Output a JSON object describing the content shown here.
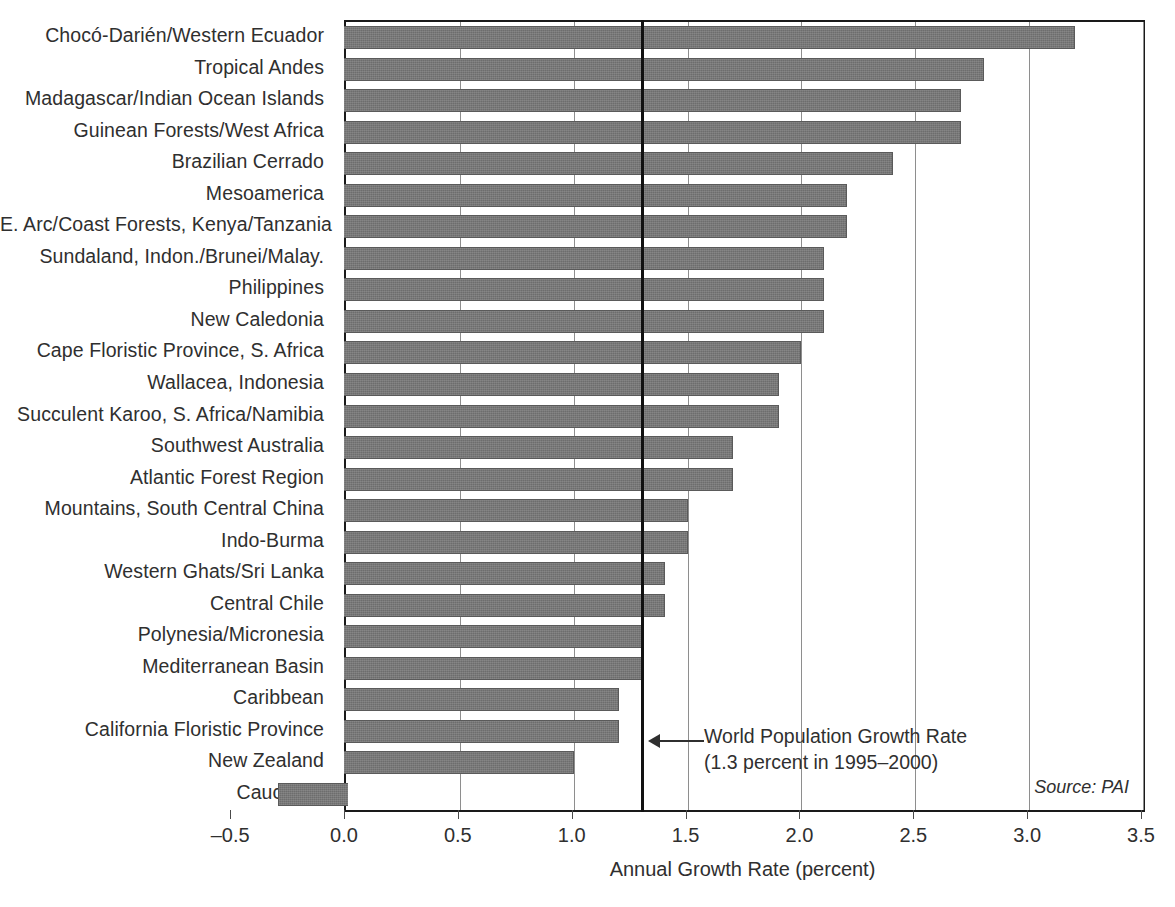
{
  "chart_data": {
    "type": "bar",
    "orientation": "horizontal",
    "title": "",
    "xlabel": "Annual Growth Rate (percent)",
    "ylabel": "",
    "xlim": [
      -0.5,
      3.5
    ],
    "xticks": [
      "-0.5",
      "0.0",
      "0.5",
      "1.0",
      "1.5",
      "2.0",
      "2.5",
      "3.0",
      "3.5"
    ],
    "xtick_values": [
      -0.5,
      0.0,
      0.5,
      1.0,
      1.5,
      2.0,
      2.5,
      3.0,
      3.5
    ],
    "grid": "vertical gridlines at 0.5 intervals",
    "legend": "none",
    "bar_color": "#6d6d6d",
    "categories": [
      "Chocó-Darién/Western Ecuador",
      "Tropical Andes",
      "Madagascar/Indian Ocean Islands",
      "Guinean Forests/West Africa",
      "Brazilian Cerrado",
      "Mesoamerica",
      "E. Arc/Coast Forests, Kenya/Tanzania",
      "Sundaland, Indon./Brunei/Malay.",
      "Philippines",
      "New Caledonia",
      "Cape Floristic Province, S. Africa",
      "Wallacea, Indonesia",
      "Succulent Karoo, S. Africa/Namibia",
      "Southwest Australia",
      "Atlantic Forest Region",
      "Mountains, South Central China",
      "Indo-Burma",
      "Western Ghats/Sri Lanka",
      "Central Chile",
      "Polynesia/Micronesia",
      "Mediterranean Basin",
      "Caribbean",
      "California Floristic Province",
      "New Zealand",
      "Caucasus"
    ],
    "values": [
      3.2,
      2.8,
      2.7,
      2.7,
      2.4,
      2.2,
      2.2,
      2.1,
      2.1,
      2.1,
      2.0,
      1.9,
      1.9,
      1.7,
      1.7,
      1.5,
      1.5,
      1.4,
      1.4,
      1.3,
      1.3,
      1.2,
      1.2,
      1.0,
      -0.3
    ],
    "annotations": [
      {
        "name": "world-population-growth-rate",
        "value": 1.3,
        "line1": "World Population Growth Rate",
        "line2": "(1.3 percent in 1995–2000)"
      }
    ],
    "source": "Source: PAI"
  },
  "axis": {
    "x_title": "Annual Growth Rate (percent)"
  },
  "annotation": {
    "line1": "World Population Growth Rate",
    "line2": "(1.3 percent in 1995–2000)"
  },
  "source": {
    "text": "Source: PAI"
  }
}
